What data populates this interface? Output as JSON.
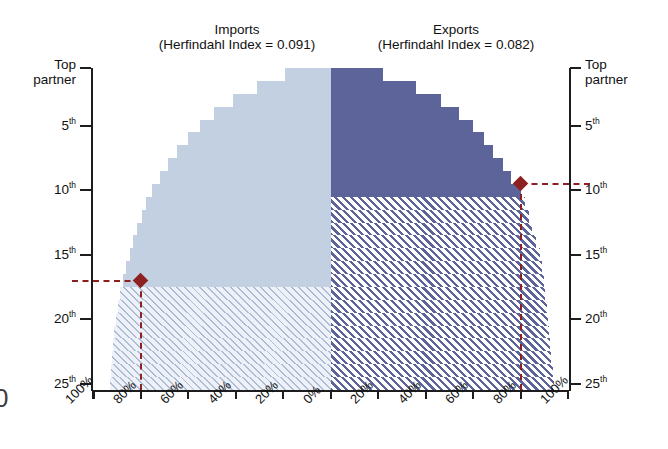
{
  "figure": {
    "top_caption_fragment": "",
    "edge_glyph": "0"
  },
  "headers": {
    "imports": {
      "title": "Imports",
      "subtitle": "(Herfindahl Index = 0.091)"
    },
    "exports": {
      "title": "Exports",
      "subtitle": "(Herfindahl Index = 0.082)"
    }
  },
  "axes": {
    "y_left_title": "Top",
    "y_left_title2": "partner",
    "y_right_title": "Top",
    "y_right_title2": "partner",
    "y_ticks": [
      {
        "label": "Top partner",
        "rank": 1
      },
      {
        "label": "5",
        "suffix": "th",
        "rank": 5
      },
      {
        "label": "10",
        "suffix": "th",
        "rank": 10
      },
      {
        "label": "15",
        "suffix": "th",
        "rank": 15
      },
      {
        "label": "20",
        "suffix": "th",
        "rank": 20
      },
      {
        "label": "25",
        "suffix": "th",
        "rank": 25
      }
    ],
    "x_ticks": [
      "100%",
      "80%",
      "60%",
      "40%",
      "20%",
      "0%",
      "20%",
      "40%",
      "60%",
      "80%",
      "100%"
    ]
  },
  "colors": {
    "imports_solid": "#c3d0e2",
    "imports_hatch": "#eef2f8",
    "exports_solid": "#5d6499",
    "exports_hatch": "#5d6499",
    "marker": "#8d2020",
    "axis": "#1d1d1d"
  },
  "markers": {
    "imports": {
      "rank": 17.5,
      "rank_label": "17.5th",
      "share": 80,
      "share_label": "80%"
    },
    "exports": {
      "rank": 10,
      "rank_label": "10th",
      "share": 80,
      "share_label": "80%"
    }
  },
  "chart_data": {
    "type": "bar",
    "subtype": "butterfly / tornado (mirrored horizontal cumulative-share bars)",
    "xlabel": "Cumulative share of trade",
    "ylabel": "Partner rank",
    "xlim": [
      100,
      0,
      100
    ],
    "ylim": [
      1,
      25
    ],
    "grid": false,
    "legend_position": "none",
    "categories": [
      "Top partner",
      "2nd",
      "3rd",
      "4th",
      "5th",
      "6th",
      "7th",
      "8th",
      "9th",
      "10th",
      "11th",
      "12th",
      "13th",
      "14th",
      "15th",
      "16th",
      "17th",
      "18th",
      "19th",
      "20th",
      "21st",
      "22nd",
      "23rd",
      "24th",
      "25th"
    ],
    "series": [
      {
        "name": "Imports",
        "herfindahl_index": 0.091,
        "direction": "left",
        "color": "#c3d0e2",
        "note": "Cumulative percent of total imports accounted for by the top-N partners",
        "values": [
          19,
          31,
          41,
          49,
          55,
          60,
          64.5,
          68.5,
          72,
          75,
          77.5,
          79.5,
          81.5,
          83,
          84.5,
          86,
          87.5,
          88.5,
          89.5,
          90.5,
          91,
          91.5,
          92,
          92.5,
          93
        ]
      },
      {
        "name": "Exports",
        "herfindahl_index": 0.082,
        "direction": "right",
        "color": "#5d6499",
        "note": "Cumulative percent of total exports accounted for by the top-N partners",
        "values": [
          22,
          36,
          46.5,
          54,
          60,
          64.5,
          68.5,
          72.5,
          76,
          80,
          82,
          83.5,
          85,
          86.5,
          88,
          89,
          90,
          90.5,
          91,
          91.5,
          92,
          92.5,
          93,
          93.5,
          94
        ]
      }
    ],
    "annotations": [
      {
        "text": "Top 17.5 import partners ≈ 80% of imports",
        "rank": 17.5,
        "share": 80,
        "side": "imports"
      },
      {
        "text": "Top 10 export partners ≈ 80% of exports",
        "rank": 10,
        "share": 80,
        "side": "exports"
      }
    ]
  }
}
